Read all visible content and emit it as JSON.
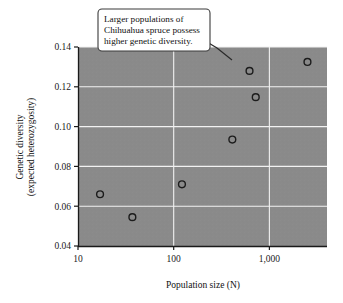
{
  "chart_data": {
    "type": "scatter",
    "title": "",
    "xlabel": "Population size (N)",
    "ylabel": "Genetic diversity\n(expected heterozygosity)",
    "ylabel_line1": "Genetic diversity",
    "ylabel_line2": "(expected heterozygosity)",
    "xscale": "log",
    "yscale": "linear",
    "xlim": [
      10,
      4000
    ],
    "ylim": [
      0.04,
      0.14
    ],
    "xticks": [
      10,
      100,
      1000
    ],
    "xtick_labels": [
      "10",
      "100",
      "1,000"
    ],
    "yticks": [
      0.04,
      0.06,
      0.08,
      0.1,
      0.12,
      0.14
    ],
    "ytick_labels": [
      "0.04",
      "0.06",
      "0.08",
      "0.10",
      "0.12",
      "0.14"
    ],
    "grid": true,
    "grid_color": "#f0f0f0",
    "plot_background": "#8a8a8a",
    "marker": "open-circle",
    "marker_edge_color": "#1c1c1c",
    "legend": null,
    "points": [
      {
        "x": 17,
        "y": 0.066
      },
      {
        "x": 37,
        "y": 0.0545
      },
      {
        "x": 122,
        "y": 0.071
      },
      {
        "x": 410,
        "y": 0.0935
      },
      {
        "x": 720,
        "y": 0.1148
      },
      {
        "x": 620,
        "y": 0.128
      },
      {
        "x": 2500,
        "y": 0.1325
      }
    ],
    "annotations": [
      {
        "name": "callout",
        "lines": [
          "Larger populations of",
          "Chihuahua spruce possess",
          "higher genetic diversity."
        ],
        "points_to": {
          "x": 620,
          "y": 0.128
        }
      }
    ]
  },
  "colors": {
    "page_background": "#ffffff",
    "plot_fill": "#8a8a8a",
    "gridline": "#f2f2f2",
    "axis": "#1a1a1a",
    "marker_stroke": "#1c1c1c",
    "callout_fill": "#ffffff",
    "callout_border": "#3a3a3a",
    "text": "#111111"
  }
}
